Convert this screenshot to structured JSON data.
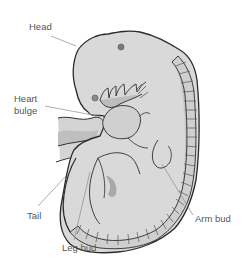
{
  "diagram": {
    "colors": {
      "background": "#ffffff",
      "body_fill": "#d9d9d9",
      "body_shade": "#bdbdbd",
      "dark_shade": "#a8a8a8",
      "outline": "#2b2b2b",
      "leader_line": "#8a8a8a",
      "label_text": "#555555",
      "eye_spot": "#7a7a7a"
    },
    "labels": [
      {
        "id": "head",
        "text": "Head"
      },
      {
        "id": "heart-bulge",
        "text": "Heart\nbulge"
      },
      {
        "id": "tail",
        "text": "Tail"
      },
      {
        "id": "leg-bud",
        "text": "Leg bud"
      },
      {
        "id": "arm-bud",
        "text": "Arm bud"
      }
    ]
  }
}
